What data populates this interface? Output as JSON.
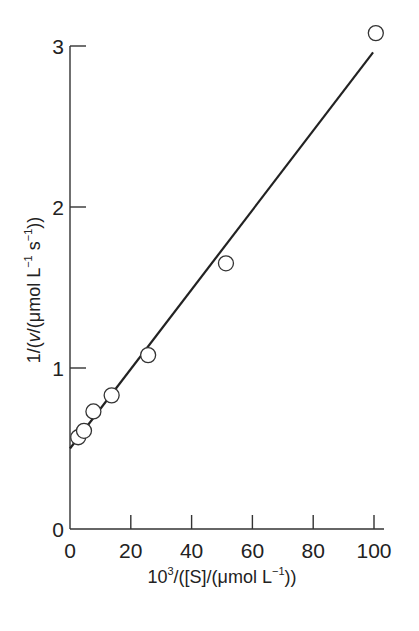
{
  "chart_data": {
    "type": "scatter",
    "title": "",
    "xlabel": "10^3/([S]/(μmol L^-1))",
    "ylabel": "1/(v/(μmol L^-1 s^-1))",
    "xlim": [
      0,
      100
    ],
    "ylim": [
      0,
      3
    ],
    "x_ticks": [
      0,
      20,
      40,
      60,
      80,
      100
    ],
    "y_ticks": [
      0,
      1,
      2,
      3
    ],
    "grid": false,
    "legend": null,
    "series": [
      {
        "name": "data",
        "marker": "open-circle",
        "x": [
          2.7,
          4.6,
          7.7,
          13.7,
          25.7,
          51.3,
          100.6
        ],
        "y": [
          0.57,
          0.61,
          0.73,
          0.83,
          1.08,
          1.65,
          3.08
        ]
      },
      {
        "name": "linear fit",
        "style": "line",
        "x": [
          0,
          99.7
        ],
        "y": [
          0.5,
          2.96
        ]
      }
    ]
  },
  "labels": {
    "x_axis_prefix": "10",
    "x_axis_sup": "3",
    "x_axis_mid": "/([S]/(μmol L",
    "x_axis_sup2": "−1",
    "x_axis_end": "))",
    "y_axis_prefix": "1/(",
    "y_axis_v": "v",
    "y_axis_mid": "/(μmol L",
    "y_axis_sup1": "−1",
    "y_axis_s": " s",
    "y_axis_sup2": "−1",
    "y_axis_end": "))"
  }
}
